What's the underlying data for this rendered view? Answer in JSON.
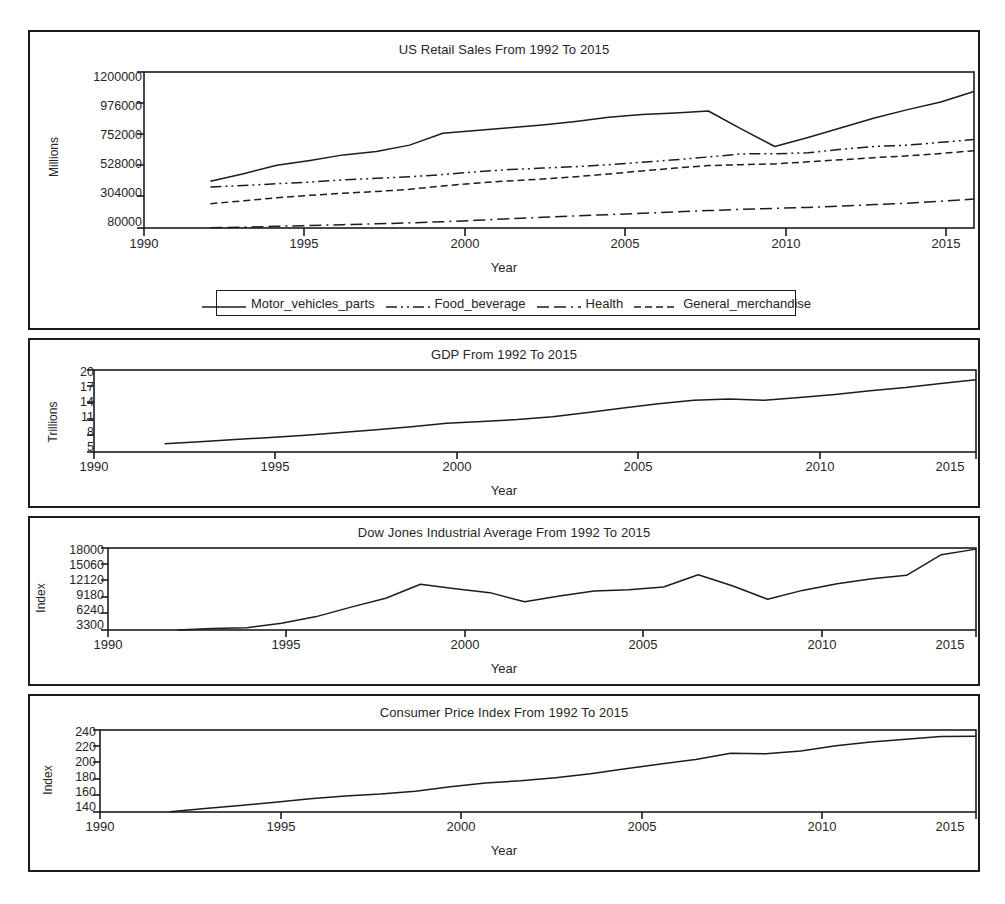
{
  "figure": {
    "background": "#ffffff",
    "line_color": "#1c1c1c",
    "text_color": "#262626"
  },
  "panels": [
    {
      "name": "retail-sales",
      "title": "US Retail Sales From 1992 To 2015",
      "ylabel": "Millions",
      "xlabel": "Year",
      "yticks": [
        "80000",
        "304000",
        "528000",
        "752000",
        "976000",
        "1200000"
      ],
      "xticks": [
        "1990",
        "1995",
        "2000",
        "2005",
        "2010",
        "2015"
      ]
    },
    {
      "name": "gdp",
      "title": "GDP From 1992 To 2015",
      "ylabel": "Trillions",
      "xlabel": "Year",
      "yticks": [
        "5",
        "8",
        "11",
        "14",
        "17",
        "20"
      ],
      "xticks": [
        "1990",
        "1995",
        "2000",
        "2005",
        "2010",
        "2015"
      ]
    },
    {
      "name": "dow-jones",
      "title": "Dow Jones Industrial Average From 1992 To 2015",
      "ylabel": "Index",
      "xlabel": "Year",
      "yticks": [
        "3300",
        "6240",
        "9180",
        "12120",
        "15060",
        "18000"
      ],
      "xticks": [
        "1990",
        "1995",
        "2000",
        "2005",
        "2010",
        "2015"
      ]
    },
    {
      "name": "cpi",
      "title": "Consumer Price Index From 1992 To 2015",
      "ylabel": "Index",
      "xlabel": "Year",
      "yticks": [
        "140",
        "160",
        "180",
        "200",
        "220",
        "240"
      ],
      "xticks": [
        "1990",
        "1995",
        "2000",
        "2005",
        "2010",
        "2015"
      ]
    }
  ],
  "legend": {
    "entries": [
      {
        "label": "Motor_vehicles_parts",
        "style": "solid"
      },
      {
        "label": "Food_beverage",
        "style": "dashdotdot"
      },
      {
        "label": "Health",
        "style": "longdashdot"
      },
      {
        "label": "General_merchandise",
        "style": "dashed"
      }
    ]
  },
  "chart_data": [
    {
      "type": "line",
      "title": "US Retail Sales From 1992 To 2015",
      "xlabel": "Year",
      "ylabel": "Millions",
      "xlim": [
        1990,
        2015
      ],
      "ylim": [
        80000,
        1200000
      ],
      "yticks": [
        80000,
        304000,
        528000,
        752000,
        976000,
        1200000
      ],
      "xticks": [
        1990,
        1995,
        2000,
        2005,
        2010,
        2015
      ],
      "grid": false,
      "legend_position": "below",
      "x": [
        1992,
        1993,
        1994,
        1995,
        1996,
        1997,
        1998,
        1999,
        2000,
        2001,
        2002,
        2003,
        2004,
        2005,
        2006,
        2007,
        2008,
        2009,
        2010,
        2011,
        2012,
        2013,
        2014,
        2015
      ],
      "series": [
        {
          "name": "Motor_vehicles_parts",
          "style": "solid",
          "values": [
            415000,
            470000,
            530000,
            565000,
            605000,
            630000,
            675000,
            760000,
            780000,
            800000,
            820000,
            845000,
            875000,
            895000,
            905000,
            920000,
            790000,
            665000,
            730000,
            800000,
            870000,
            930000,
            985000,
            1060000
          ]
        },
        {
          "name": "Food_beverage",
          "style": "dashdotdot",
          "values": [
            375000,
            385000,
            398000,
            410000,
            425000,
            437000,
            448000,
            464000,
            483000,
            500000,
            510000,
            520000,
            535000,
            552000,
            570000,
            590000,
            612000,
            613000,
            620000,
            645000,
            665000,
            675000,
            695000,
            715000
          ]
        },
        {
          "name": "Health",
          "style": "longdashdot",
          "values": [
            82000,
            86000,
            92000,
            98000,
            104000,
            110000,
            117000,
            125000,
            135000,
            146000,
            157000,
            167000,
            176000,
            186000,
            196000,
            205000,
            214000,
            221000,
            228000,
            238000,
            248000,
            258000,
            272000,
            288000
          ]
        },
        {
          "name": "General_merchandise",
          "style": "dashed",
          "values": [
            255000,
            275000,
            297000,
            315000,
            330000,
            342000,
            358000,
            382000,
            402000,
            418000,
            432000,
            448000,
            468000,
            490000,
            510000,
            528000,
            535000,
            540000,
            555000,
            570000,
            585000,
            598000,
            615000,
            635000
          ]
        }
      ]
    },
    {
      "type": "line",
      "title": "GDP From 1992 To 2015",
      "xlabel": "Year",
      "ylabel": "Trillions",
      "xlim": [
        1990,
        2015
      ],
      "ylim": [
        5,
        20
      ],
      "yticks": [
        5,
        8,
        11,
        14,
        17,
        20
      ],
      "xticks": [
        1990,
        1995,
        2000,
        2005,
        2010,
        2015
      ],
      "grid": false,
      "x": [
        1992,
        1993,
        1994,
        1995,
        1996,
        1997,
        1998,
        1999,
        2000,
        2001,
        2002,
        2003,
        2004,
        2005,
        2006,
        2007,
        2008,
        2009,
        2010,
        2011,
        2012,
        2013,
        2014,
        2015
      ],
      "series": [
        {
          "name": "GDP",
          "style": "solid",
          "values": [
            6.52,
            6.86,
            7.29,
            7.64,
            8.07,
            8.58,
            9.06,
            9.63,
            10.25,
            10.58,
            10.94,
            11.46,
            12.21,
            13.04,
            13.81,
            14.45,
            14.71,
            14.45,
            14.99,
            15.54,
            16.2,
            16.78,
            17.52,
            18.22
          ]
        }
      ]
    },
    {
      "type": "line",
      "title": "Dow Jones Industrial Average From 1992 To 2015",
      "xlabel": "Year",
      "ylabel": "Index",
      "xlim": [
        1990,
        2015
      ],
      "ylim": [
        3300,
        18000
      ],
      "yticks": [
        3300,
        6240,
        9180,
        12120,
        15060,
        18000
      ],
      "xticks": [
        1990,
        1995,
        2000,
        2005,
        2010,
        2015
      ],
      "grid": false,
      "x": [
        1992,
        1993,
        1994,
        1995,
        1996,
        1997,
        1998,
        1999,
        2000,
        2001,
        2002,
        2003,
        2004,
        2005,
        2006,
        2007,
        2008,
        2009,
        2010,
        2011,
        2012,
        2013,
        2014,
        2015
      ],
      "series": [
        {
          "name": "DJIA",
          "style": "solid",
          "values": [
            3300,
            3550,
            3700,
            4500,
            5700,
            7400,
            9000,
            11500,
            10700,
            10000,
            8350,
            9400,
            10300,
            10500,
            11000,
            13200,
            11200,
            8800,
            10400,
            11600,
            12500,
            13100,
            16800,
            17800
          ]
        }
      ]
    },
    {
      "type": "line",
      "title": "Consumer Price Index From 1992 To 2015",
      "xlabel": "Year",
      "ylabel": "Index",
      "xlim": [
        1990,
        2015
      ],
      "ylim": [
        140,
        245
      ],
      "yticks": [
        140,
        160,
        180,
        200,
        220,
        240
      ],
      "xticks": [
        1990,
        1995,
        2000,
        2005,
        2010,
        2015
      ],
      "grid": false,
      "x": [
        1992,
        1993,
        1994,
        1995,
        1996,
        1997,
        1998,
        1999,
        2000,
        2001,
        2002,
        2003,
        2004,
        2005,
        2006,
        2007,
        2008,
        2009,
        2010,
        2011,
        2012,
        2013,
        2014,
        2015
      ],
      "series": [
        {
          "name": "CPI",
          "style": "solid",
          "values": [
            140.3,
            144.5,
            148.2,
            152.4,
            156.9,
            160.5,
            163.0,
            166.6,
            172.2,
            177.1,
            179.9,
            184.0,
            188.9,
            195.3,
            201.6,
            207.3,
            215.3,
            214.5,
            218.1,
            224.9,
            229.6,
            233.0,
            236.7,
            237.0
          ]
        }
      ]
    }
  ]
}
